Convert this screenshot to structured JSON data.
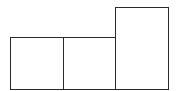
{
  "diagram": {
    "stroke_color": "#2a2a2a",
    "fill_color": "#ffffff",
    "boxes": [
      {
        "id": "box-1",
        "x": 10,
        "y": 37,
        "width": 54,
        "height": 53
      },
      {
        "id": "box-2",
        "x": 63,
        "y": 37,
        "width": 53,
        "height": 53
      },
      {
        "id": "box-3",
        "x": 115,
        "y": 7,
        "width": 54,
        "height": 83
      }
    ]
  }
}
